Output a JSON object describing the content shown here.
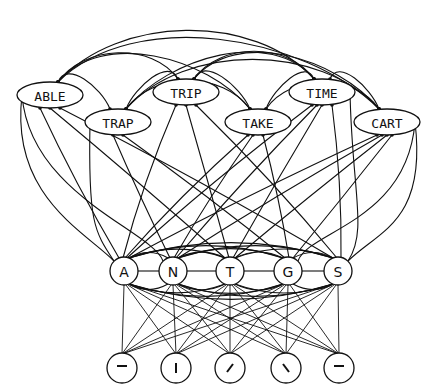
{
  "diagram": {
    "title": "",
    "colors": {
      "ink": "#111111",
      "background": "#ffffff"
    },
    "word_nodes": [
      {
        "id": "able",
        "label": "ABLE",
        "x": 50,
        "y": 95
      },
      {
        "id": "trap",
        "label": "TRAP",
        "x": 118,
        "y": 122
      },
      {
        "id": "trip",
        "label": "TRIP",
        "x": 186,
        "y": 92
      },
      {
        "id": "take",
        "label": "TAKE",
        "x": 258,
        "y": 122
      },
      {
        "id": "time",
        "label": "TIME",
        "x": 322,
        "y": 92
      },
      {
        "id": "cart",
        "label": "CART",
        "x": 387,
        "y": 122
      }
    ],
    "letter_nodes": [
      {
        "id": "a",
        "label": "A",
        "x": 124,
        "y": 271
      },
      {
        "id": "n",
        "label": "N",
        "x": 173,
        "y": 271
      },
      {
        "id": "t",
        "label": "T",
        "x": 230,
        "y": 271
      },
      {
        "id": "g",
        "label": "G",
        "x": 288,
        "y": 271
      },
      {
        "id": "s",
        "label": "S",
        "x": 338,
        "y": 271
      }
    ],
    "feature_nodes": [
      {
        "id": "f1",
        "glyph": "horizontal-bar",
        "x": 122,
        "y": 368
      },
      {
        "id": "f2",
        "glyph": "vertical-bar",
        "x": 176,
        "y": 368
      },
      {
        "id": "f3",
        "glyph": "forward-slash",
        "x": 230,
        "y": 368
      },
      {
        "id": "f4",
        "glyph": "back-slash",
        "x": 286,
        "y": 368
      },
      {
        "id": "f5",
        "glyph": "horizontal-bar",
        "x": 339,
        "y": 368
      }
    ],
    "layers": [
      "word level",
      "letter level",
      "feature level"
    ]
  }
}
